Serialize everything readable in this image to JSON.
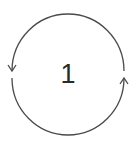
{
  "diagram": {
    "type": "cycle",
    "center_label": "1",
    "arcs": [
      {
        "name": "left-arc",
        "direction": "counterclockwise-down",
        "arrow": "arrow-down-icon"
      },
      {
        "name": "right-arc",
        "direction": "counterclockwise-up",
        "arrow": "arrow-up-icon"
      }
    ],
    "stroke_color": "#4a4a4a",
    "label_color": "#2a2a2a"
  }
}
